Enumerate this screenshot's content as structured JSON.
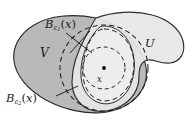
{
  "figure": {
    "background_color": "#ffffff",
    "outline_color": "#2b2b2b",
    "fill_V": "#b9b9b9",
    "fill_U": "#e6e6e6",
    "fill_inner": "#efefef",
    "dash_color": "#1f1f1f",
    "point_color": "#000000"
  },
  "labels": {
    "ball_inner": {
      "base": "B",
      "sub": "ε",
      "subsub": "1",
      "arg": "(x)"
    },
    "ball_outer": {
      "base": "B",
      "sub": "ε",
      "subsub": "2",
      "arg": "(x)"
    },
    "set_V": "V",
    "set_U": "U",
    "point_x": "x"
  },
  "shapes": {
    "set_V_name": "blob-region-V",
    "set_U_name": "blob-region-U",
    "inner_ball_name": "dashed-circle-epsilon-1",
    "outer_ball_name": "dashed-circle-epsilon-2",
    "center_point_name": "center-point-x"
  },
  "geometry": {
    "center": {
      "x": 104,
      "y": 68
    },
    "radius_epsilon_1": 21,
    "radius_epsilon_2": 44
  }
}
